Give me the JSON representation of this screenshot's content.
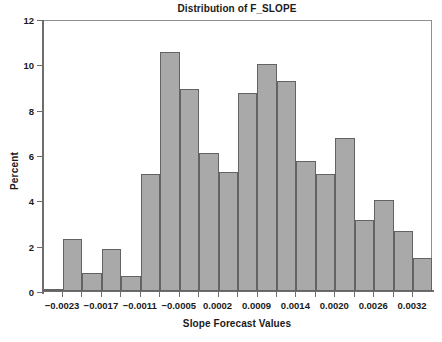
{
  "chart_data": {
    "type": "bar",
    "title": "Distribution of F_SLOPE",
    "xlabel": "Slope Forecast Values",
    "ylabel": "Percent",
    "ylim": [
      0,
      12
    ],
    "grid": false,
    "legend": null,
    "y_ticks": [
      "0",
      "2",
      "4",
      "6",
      "8",
      "10",
      "12"
    ],
    "y_tick_values": [
      0,
      2,
      4,
      6,
      8,
      10,
      12
    ],
    "x_ticks": [
      "-0.0023",
      "-0.0017",
      "-0.0011",
      "-0.0005",
      "0.0002",
      "0.0009",
      "0.0014",
      "0.0020",
      "0.0026",
      "0.0032"
    ],
    "x_tick_display": [
      "−0.0023",
      "−0.0017",
      "−0.0011",
      "−0.0005",
      "0.0002",
      "0.0009",
      "0.0014",
      "0.0020",
      "0.0026",
      "0.0032"
    ],
    "bar_color": "#a9a9a9",
    "bar_edge_color": "#636363",
    "categories": [
      "-0.0026",
      "-0.0023",
      "-0.0020",
      "-0.0017",
      "-0.0014",
      "-0.0011",
      "-0.0008",
      "-0.0005",
      "-0.0001",
      "0.0002",
      "0.0006",
      "0.0009",
      "0.0012",
      "0.0016",
      "0.0019",
      "0.0022",
      "0.0026",
      "0.0029",
      "0.0033"
    ],
    "values": [
      0.1,
      2.3,
      0.8,
      1.85,
      0.65,
      5.15,
      10.55,
      8.9,
      6.1,
      5.25,
      8.75,
      10.0,
      9.25,
      5.75,
      5.15,
      6.75,
      3.15,
      4.0,
      2.65
    ],
    "values_tail": [
      1.45
    ]
  },
  "figure": {
    "caption_remnant": ""
  }
}
